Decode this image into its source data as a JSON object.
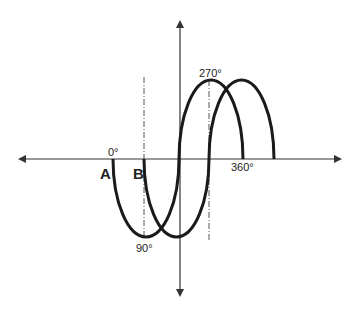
{
  "diagram": {
    "title": "",
    "waveforms": [
      {
        "name": "A",
        "label": "A"
      },
      {
        "name": "B",
        "label": "B"
      }
    ],
    "angle_labels": {
      "deg0": "0°",
      "deg90": "90°",
      "deg270": "270°",
      "deg360": "360°"
    },
    "phase_shift_degrees": 90,
    "colors": {
      "curve": "#1a1a1a",
      "axis": "#333333",
      "reference_line": "#555555",
      "background": "#ffffff"
    }
  }
}
